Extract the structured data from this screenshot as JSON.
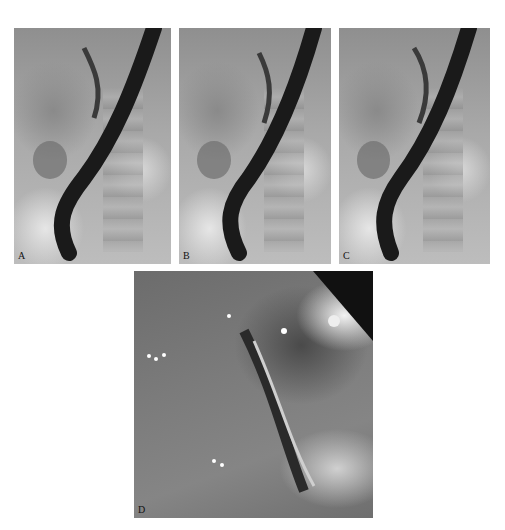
{
  "figure": {
    "panels": [
      {
        "id": "A",
        "label": "A",
        "type": "fluoroscopy"
      },
      {
        "id": "B",
        "label": "B",
        "type": "fluoroscopy"
      },
      {
        "id": "C",
        "label": "C",
        "type": "fluoroscopy"
      },
      {
        "id": "D",
        "label": "D",
        "type": "endoscopy"
      }
    ]
  }
}
